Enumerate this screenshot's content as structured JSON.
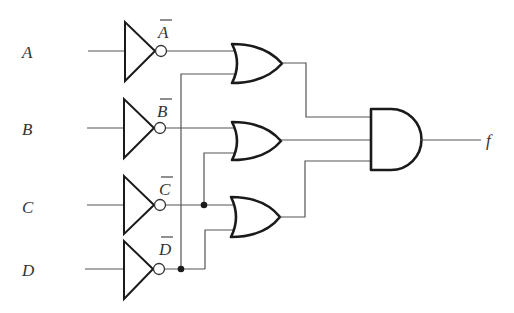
{
  "diagram": {
    "type": "logic-circuit",
    "inputs": [
      {
        "id": "A",
        "label": "A",
        "inverted_label": "A"
      },
      {
        "id": "B",
        "label": "B",
        "inverted_label": "B"
      },
      {
        "id": "C",
        "label": "C",
        "inverted_label": "C"
      },
      {
        "id": "D",
        "label": "D",
        "inverted_label": "D"
      }
    ],
    "gates": [
      {
        "id": "not_a",
        "type": "NOT",
        "input": "A"
      },
      {
        "id": "not_b",
        "type": "NOT",
        "input": "B"
      },
      {
        "id": "not_c",
        "type": "NOT",
        "input": "C"
      },
      {
        "id": "not_d",
        "type": "NOT",
        "input": "D"
      },
      {
        "id": "or1",
        "type": "OR",
        "inputs": [
          "A'",
          "D'"
        ]
      },
      {
        "id": "or2",
        "type": "OR",
        "inputs": [
          "B'",
          "C'"
        ]
      },
      {
        "id": "or3",
        "type": "OR",
        "inputs": [
          "C'",
          "D'"
        ]
      },
      {
        "id": "and1",
        "type": "AND",
        "inputs": [
          "or1",
          "or2",
          "or3"
        ]
      }
    ],
    "output": {
      "label": "f"
    }
  }
}
